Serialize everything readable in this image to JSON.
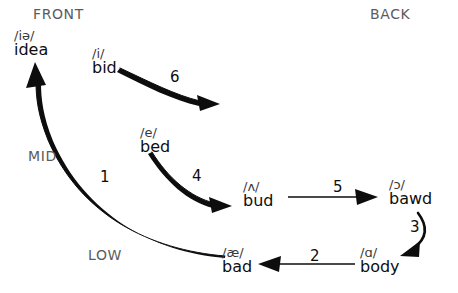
{
  "diagram": {
    "region_labels": [
      {
        "name": "front",
        "text": "FRONT"
      },
      {
        "name": "back",
        "text": "BACK"
      },
      {
        "name": "mid",
        "text": "MID"
      },
      {
        "name": "low",
        "text": "LOW"
      }
    ],
    "vowels": [
      {
        "id": "idea",
        "ipa": "/iə/",
        "word": "idea"
      },
      {
        "id": "bid",
        "ipa": "/i/",
        "word": "bid"
      },
      {
        "id": "bed",
        "ipa": "/e/",
        "word": "bed"
      },
      {
        "id": "bud",
        "ipa": "/ʌ/",
        "word": "bud"
      },
      {
        "id": "bawd",
        "ipa": "/ɔ/",
        "word": "bawd"
      },
      {
        "id": "body",
        "ipa": "/ɑ/",
        "word": "body"
      },
      {
        "id": "bad",
        "ipa": "/æ/",
        "word": "bad"
      }
    ],
    "arrows": [
      {
        "number": "1",
        "from": "bad",
        "to": "idea"
      },
      {
        "number": "2",
        "from": "body",
        "to": "bad"
      },
      {
        "number": "3",
        "from": "bawd",
        "to": "body"
      },
      {
        "number": "4",
        "from": "bed",
        "to": "bud"
      },
      {
        "number": "5",
        "from": "bud",
        "to": "bawd"
      },
      {
        "number": "6",
        "from": "bid",
        "to": "bud"
      }
    ],
    "colors": {
      "ink": "#0d0d0d",
      "region_text": "#5b5b5b",
      "ipa_text": "#3a3a3a",
      "background": "#ffffff"
    }
  }
}
